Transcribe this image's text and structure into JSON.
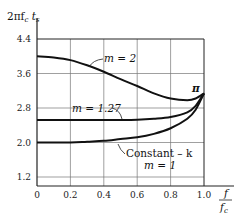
{
  "chart_data": {
    "type": "line",
    "title": "",
    "ylabel": "2πf_c t_s",
    "xlabel": "f / f_c",
    "xlim": [
      0,
      1.0
    ],
    "ylim": [
      1.2,
      4.4
    ],
    "x_ticks": [
      0,
      0.2,
      0.4,
      0.6,
      0.8,
      1.0
    ],
    "x_tick_labels": [
      "0",
      "0.2",
      "0.4",
      "0.6",
      "0.8",
      "1.0"
    ],
    "y_ticks": [
      1.2,
      2.0,
      2.8,
      3.6,
      4.4
    ],
    "y_tick_labels": [
      "1.2",
      "2.0",
      "2.8",
      "3.6",
      "4.4"
    ],
    "grid": true,
    "legend": "none (inline annotations)",
    "series": [
      {
        "name": "m = 2",
        "x": [
          0,
          0.1,
          0.2,
          0.3,
          0.4,
          0.5,
          0.6,
          0.7,
          0.8,
          0.9,
          0.95,
          1.0
        ],
        "values": [
          4.0,
          3.97,
          3.91,
          3.79,
          3.64,
          3.47,
          3.31,
          3.14,
          3.02,
          2.98,
          3.02,
          3.14
        ]
      },
      {
        "name": "m = 1.27",
        "x": [
          0,
          0.2,
          0.4,
          0.6,
          0.7,
          0.8,
          0.9,
          0.95,
          1.0
        ],
        "values": [
          2.52,
          2.52,
          2.52,
          2.53,
          2.55,
          2.59,
          2.7,
          2.85,
          3.14
        ]
      },
      {
        "name": "Constant-k, m = 1",
        "x": [
          0,
          0.2,
          0.3,
          0.4,
          0.5,
          0.6,
          0.7,
          0.8,
          0.9,
          0.95,
          1.0
        ],
        "values": [
          2.0,
          2.0,
          2.02,
          2.04,
          2.08,
          2.12,
          2.2,
          2.33,
          2.55,
          2.76,
          3.14
        ]
      }
    ],
    "annotations": [
      {
        "text": "m = 2",
        "points_to": {
          "x": 0.35,
          "y": 3.72
        }
      },
      {
        "text": "m = 1.27",
        "points_to": {
          "x": 0.5,
          "y": 2.52
        }
      },
      {
        "text": "Constant - k",
        "points_to": {
          "x": 0.45,
          "y": 2.06
        }
      },
      {
        "text": "m = 1",
        "points_to": null
      },
      {
        "text": "π",
        "points_to": {
          "x": 1.0,
          "y": 3.14
        }
      }
    ]
  },
  "labels": {
    "y_axis": {
      "main": "2πf",
      "sub1": "c",
      "mid": " t",
      "sub2": "s"
    },
    "x_axis": {
      "num": "f",
      "den": "f",
      "den_sub": "c"
    },
    "pi": "π",
    "m2": "m = 2",
    "m127": "m = 1.27",
    "constk": "Constant – k",
    "m1": "m = 1"
  }
}
